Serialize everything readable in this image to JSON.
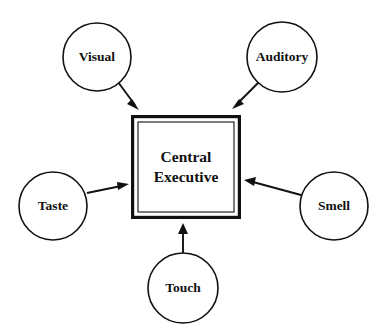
{
  "diagram": {
    "type": "radial-hub-and-spoke",
    "title": "Central Executive",
    "background_color": "#ffffff",
    "stroke_color": "#111111",
    "center": {
      "name": "central-executive",
      "label_line1": "Central",
      "label_line2": "Executive",
      "shape": "double-bordered-square",
      "x": 131,
      "y": 115,
      "width": 110,
      "height": 104
    },
    "nodes": [
      {
        "id": "visual",
        "label": "Visual",
        "shape": "circle",
        "cx": 97,
        "cy": 57,
        "r": 34
      },
      {
        "id": "auditory",
        "label": "Auditory",
        "shape": "circle",
        "cx": 282,
        "cy": 57,
        "r": 35
      },
      {
        "id": "taste",
        "label": "Taste",
        "shape": "circle",
        "cx": 53,
        "cy": 206,
        "r": 34
      },
      {
        "id": "smell",
        "label": "Smell",
        "shape": "circle",
        "cx": 334,
        "cy": 206,
        "r": 34
      },
      {
        "id": "touch",
        "label": "Touch",
        "shape": "circle",
        "cx": 183,
        "cy": 288,
        "r": 35
      }
    ],
    "arrows": [
      {
        "id": "visual-to-center",
        "from": "visual",
        "to": "central-executive",
        "direction": "to-center",
        "x1": 118,
        "y1": 82,
        "x2": 139,
        "y2": 110
      },
      {
        "id": "auditory-to-center",
        "from": "auditory",
        "to": "central-executive",
        "direction": "to-center",
        "x1": 259,
        "y1": 82,
        "x2": 233,
        "y2": 109
      },
      {
        "id": "taste-to-center",
        "from": "taste",
        "to": "central-executive",
        "direction": "to-center",
        "x1": 87,
        "y1": 193,
        "x2": 128,
        "y2": 184
      },
      {
        "id": "smell-to-center",
        "from": "smell",
        "to": "central-executive",
        "direction": "to-center",
        "x1": 301,
        "y1": 195,
        "x2": 245,
        "y2": 180
      },
      {
        "id": "touch-to-center",
        "from": "touch",
        "to": "central-executive",
        "direction": "to-center",
        "x1": 183,
        "y1": 253,
        "x2": 183,
        "y2": 223
      }
    ]
  }
}
